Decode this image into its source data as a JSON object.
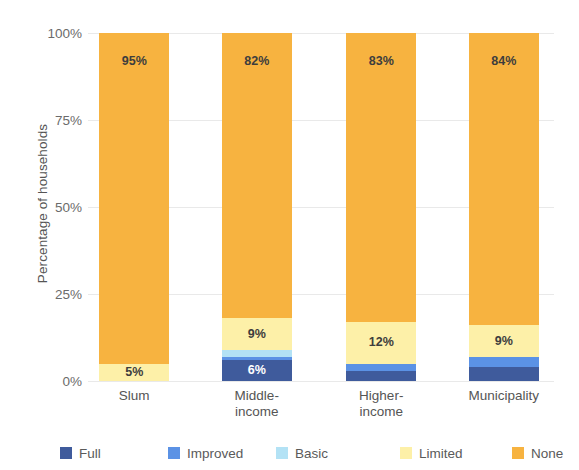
{
  "chart_data": {
    "type": "bar",
    "subtype": "stacked-bar-100-percent",
    "title": "",
    "xlabel": "",
    "ylabel": "Percentage of households",
    "ylim": [
      0,
      100
    ],
    "ytick_labels": [
      "0%",
      "25%",
      "50%",
      "75%",
      "100%"
    ],
    "ytick_values": [
      0,
      25,
      50,
      75,
      100
    ],
    "grid": true,
    "legend_position": "bottom",
    "categories": [
      "Slum",
      "Middle-income",
      "Higher-income",
      "Municipality"
    ],
    "category_lines": [
      [
        "Slum"
      ],
      [
        "Middle-",
        "income"
      ],
      [
        "Higher-",
        "income"
      ],
      [
        "Municipality"
      ]
    ],
    "series": [
      {
        "name": "Full",
        "color": "#3f5b9c",
        "values": [
          0,
          6,
          3,
          4
        ],
        "labels": [
          "",
          "6%",
          "",
          ""
        ]
      },
      {
        "name": "Improved",
        "color": "#5b92e5",
        "values": [
          0,
          1,
          2,
          3
        ],
        "labels": [
          "",
          "",
          "",
          ""
        ]
      },
      {
        "name": "Basic",
        "color": "#b3e2f5",
        "values": [
          0,
          2,
          0,
          0
        ],
        "labels": [
          "",
          "",
          "",
          ""
        ]
      },
      {
        "name": "Limited",
        "color": "#fdf0a8",
        "values": [
          5,
          9,
          12,
          9
        ],
        "labels": [
          "5%",
          "9%",
          "12%",
          "9%"
        ]
      },
      {
        "name": "None",
        "color": "#f5b council",
        "values": [
          95,
          82,
          83,
          84
        ],
        "labels": [
          "95%",
          "82%",
          "83%",
          "84%"
        ]
      }
    ]
  },
  "axis": {
    "y_title": "Percentage of households"
  },
  "legend": {
    "items": [
      {
        "label": "Full",
        "color": "#3f5b9c"
      },
      {
        "label": "Improved",
        "color": "#5b92e5"
      },
      {
        "label": "Basic",
        "color": "#b3e2f5"
      },
      {
        "label": "Limited",
        "color": "#fdf0a8"
      },
      {
        "label": "None",
        "color": "#f7b340"
      }
    ]
  }
}
